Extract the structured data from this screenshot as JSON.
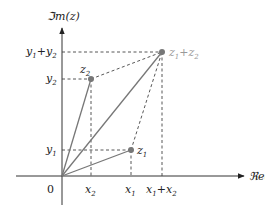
{
  "diagram": {
    "axes": {
      "x_label": "ℜe(z)",
      "y_label": "ℑm(z)",
      "origin_label": "0"
    },
    "points": [
      {
        "id": "z1",
        "label": "z",
        "sub": "1",
        "x": 131,
        "y": 150
      },
      {
        "id": "z2",
        "label": "z",
        "sub": "2",
        "x": 91,
        "y": 79
      },
      {
        "id": "z1z2",
        "label_a": "z",
        "sub_a": "1",
        "plus": "+",
        "label_b": "z",
        "sub_b": "2",
        "x": 162,
        "y": 52
      }
    ],
    "x_ticks": [
      {
        "label": "x",
        "sub": "2"
      },
      {
        "label": "x",
        "sub": "1"
      },
      {
        "label_a": "x",
        "sub_a": "1",
        "plus": "+",
        "label_b": "x",
        "sub_b": "2"
      }
    ],
    "y_ticks": [
      {
        "label": "y",
        "sub": "1"
      },
      {
        "label": "y",
        "sub": "2"
      },
      {
        "label_a": "y",
        "sub_a": "1",
        "plus": "+",
        "label_b": "y",
        "sub_b": "2"
      }
    ],
    "colors": {
      "axis": "#333333",
      "vector": "#777777",
      "point": "#777777",
      "dashed": "#444444",
      "sum_label": "#999999"
    }
  }
}
